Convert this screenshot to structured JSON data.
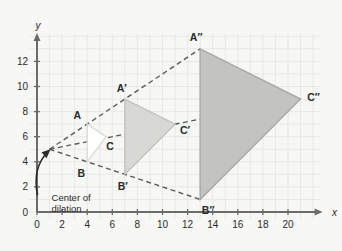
{
  "figure": {
    "axes": {
      "x_label": "x",
      "y_label": "y",
      "x_ticks": [
        0,
        2,
        4,
        6,
        8,
        10,
        12,
        14,
        16,
        18,
        20
      ],
      "y_ticks": [
        0,
        2,
        4,
        6,
        8,
        10,
        12
      ],
      "x_tick_labels": [
        "0",
        "2",
        "4",
        "6",
        "8",
        "10",
        "12",
        "14",
        "16",
        "18",
        "20"
      ],
      "y_tick_labels": [
        "0",
        "2",
        "4",
        "6",
        "8",
        "10",
        "12"
      ],
      "x_range": [
        -0.6,
        22.6
      ],
      "y_range": [
        -0.6,
        14.2
      ],
      "grid": true,
      "grid_step": 1
    },
    "annotation": {
      "label_line1": "Center of",
      "label_line2": "dilation",
      "target_x": 1,
      "target_y": 5
    },
    "center_of_dilation": {
      "x": 1,
      "y": 5
    },
    "vertices": {
      "A": {
        "label": "A",
        "x": 4,
        "y": 7
      },
      "B": {
        "label": "B",
        "x": 4,
        "y": 4
      },
      "C": {
        "label": "C",
        "x": 5.5,
        "y": 6
      },
      "A1": {
        "label": "A′",
        "x": 7,
        "y": 9
      },
      "B1": {
        "label": "B′",
        "x": 7,
        "y": 3
      },
      "C1": {
        "label": "C′",
        "x": 11,
        "y": 7
      },
      "A2": {
        "label": "A″",
        "x": 13,
        "y": 13
      },
      "B2": {
        "label": "B″",
        "x": 13,
        "y": 1
      },
      "C2": {
        "label": "C″",
        "x": 21,
        "y": 9
      }
    },
    "triangles": [
      {
        "name": "ABC",
        "points": [
          "A",
          "B",
          "C"
        ],
        "fill": "#ffffff",
        "stroke": "#dddbd6"
      },
      {
        "name": "A1B1C1",
        "points": [
          "A1",
          "B1",
          "C1"
        ],
        "fill": "#d8d8d4",
        "stroke": "#c2c2bd"
      },
      {
        "name": "A2B2C2",
        "points": [
          "A2",
          "B2",
          "C2"
        ],
        "fill": "#c3c3c0",
        "stroke": "#a9a9a5"
      }
    ],
    "rays": [
      {
        "name": "ray-A",
        "from": "center",
        "to": "A2"
      },
      {
        "name": "ray-B",
        "from": "center",
        "to": "B2"
      },
      {
        "name": "ray-C",
        "from": "center",
        "to": "C2"
      }
    ],
    "colors": {
      "background": "#f7f7f5",
      "grid": "#e7e9e6",
      "axis": "#6b6b6b",
      "dash": "#5a5a5a",
      "text": "#2b2b2b"
    }
  }
}
